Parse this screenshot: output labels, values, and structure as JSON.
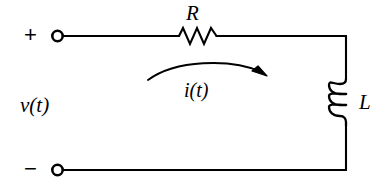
{
  "figure": {
    "background_color": "#ffffff",
    "ink_color": "#000000"
  },
  "labels": {
    "resistor": "R",
    "inductor": "L",
    "source_voltage": "v(t)",
    "loop_current": "i(t)",
    "terminal_positive": "+",
    "terminal_negative": "−"
  },
  "components": {
    "resistor": {
      "name": "resistor",
      "symbol": "zigzag",
      "orientation": "horizontal",
      "peaks": 4
    },
    "inductor": {
      "name": "inductor",
      "symbol": "coil",
      "orientation": "vertical",
      "loops": 3
    },
    "terminal_top": {
      "name": "open-terminal",
      "symbol": "open-circle",
      "polarity": "+"
    },
    "terminal_bottom": {
      "name": "open-terminal",
      "symbol": "open-circle",
      "polarity": "−"
    },
    "current_arrow": {
      "name": "current-direction-arrow",
      "symbol": "curved-arrow",
      "direction": "left-to-right (clockwise)"
    }
  },
  "wires": [
    {
      "name": "top-wire",
      "from": "top terminal",
      "to": "top-right corner"
    },
    {
      "name": "right-wire",
      "from": "top-right corner",
      "to": "bottom-right corner"
    },
    {
      "name": "bottom-wire",
      "from": "bottom-right corner",
      "to": "bottom terminal"
    }
  ]
}
